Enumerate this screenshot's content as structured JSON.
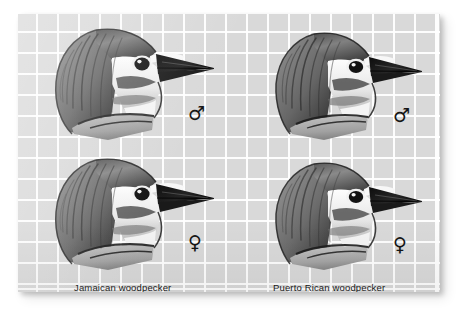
{
  "figure": {
    "kind": "comparative-illustration-plate",
    "background_color": "#ffffff",
    "plate_color": "#d9d9d9",
    "grid_line_color": "#ffffff",
    "ink_color": "#151515",
    "caption_color": "#1b1b1b",
    "alt": "Grayscale pencil illustrations of four woodpecker heads in profile, arranged two by two, comparing male and female Jamaican and Puerto Rican woodpeckers on graph paper."
  },
  "columns": [
    {
      "id": "jamaican",
      "label": "Jamaican woodpecker"
    },
    {
      "id": "puertorican",
      "label": "Puerto Rican woodpecker"
    }
  ],
  "rows": [
    {
      "id": "male",
      "symbol": "♂",
      "symbol_name": "male-symbol"
    },
    {
      "id": "female",
      "symbol": "♀",
      "symbol_name": "female-symbol"
    }
  ],
  "specimens": [
    {
      "id": "jamaican-male",
      "species": "Jamaican woodpecker",
      "sex": "male",
      "symbol": "♂",
      "subject": "woodpecker head in left-facing profile"
    },
    {
      "id": "puertorican-male",
      "species": "Puerto Rican woodpecker",
      "sex": "male",
      "symbol": "♂",
      "subject": "woodpecker head in left-facing profile"
    },
    {
      "id": "jamaican-female",
      "species": "Jamaican woodpecker",
      "sex": "female",
      "symbol": "♀",
      "subject": "woodpecker head in left-facing profile"
    },
    {
      "id": "puertorican-female",
      "species": "Puerto Rican woodpecker",
      "sex": "female",
      "symbol": "♀",
      "subject": "woodpecker head in left-facing profile"
    }
  ]
}
